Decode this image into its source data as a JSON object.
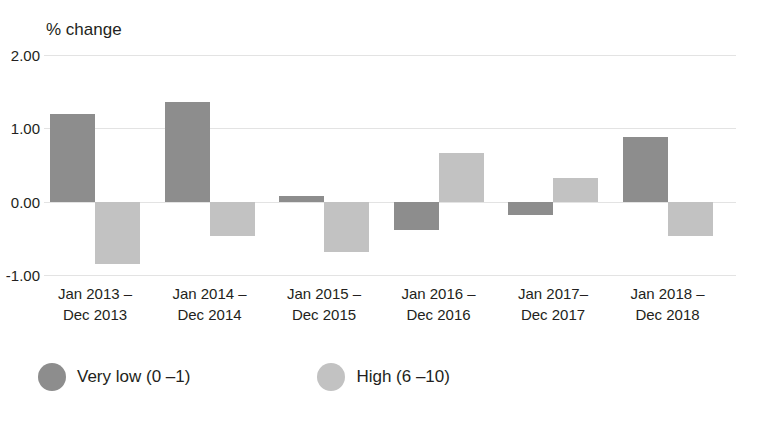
{
  "chart_data": {
    "type": "bar",
    "title": "",
    "ylabel": "% change",
    "xlabel": "",
    "ylim": [
      -1.0,
      2.0
    ],
    "yticks": [
      "2.00",
      "1.00",
      "0.00",
      "-1.00"
    ],
    "ytick_values": [
      2.0,
      1.0,
      0.0,
      -1.0
    ],
    "grid": true,
    "legend_position": "bottom-left",
    "categories": [
      "Jan 2013 –\nDec 2013",
      "Jan 2014 –\nDec 2014",
      "Jan 2015 –\nDec 2015",
      "Jan 2016 –\nDec 2016",
      "Jan 2017–\nDec 2017",
      "Jan 2018 –\nDec 2018"
    ],
    "category_lines": [
      {
        "line1": "Jan 2013 –",
        "line2": "Dec 2013"
      },
      {
        "line1": "Jan 2014 –",
        "line2": "Dec 2014"
      },
      {
        "line1": "Jan 2015 –",
        "line2": "Dec 2015"
      },
      {
        "line1": "Jan 2016 –",
        "line2": "Dec 2016"
      },
      {
        "line1": "Jan 2017–",
        "line2": "Dec 2017"
      },
      {
        "line1": "Jan 2018 –",
        "line2": "Dec 2018"
      }
    ],
    "series": [
      {
        "name": "Very low (0 –1)",
        "color": "#8d8d8d",
        "values": [
          1.19,
          1.36,
          0.08,
          -0.39,
          -0.18,
          0.88
        ]
      },
      {
        "name": "High (6 –10)",
        "color": "#c2c2c2",
        "values": [
          -0.85,
          -0.47,
          -0.68,
          0.67,
          0.32,
          -0.47
        ]
      }
    ]
  },
  "legend": {
    "items": [
      {
        "label": "Very low (0 –1)",
        "color": "#8d8d8d"
      },
      {
        "label": "High (6 –10)",
        "color": "#c2c2c2"
      }
    ]
  },
  "colors": {
    "very_low": "#8d8d8d",
    "high": "#c2c2c2",
    "gridline": "#e3e3e3",
    "text": "#231f20",
    "background": "#ffffff"
  }
}
